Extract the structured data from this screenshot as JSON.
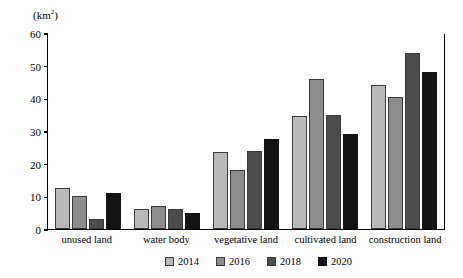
{
  "chart_data": {
    "type": "bar",
    "title": "",
    "xlabel": "",
    "ylabel": "(km2)",
    "ylabel_base": "(km",
    "ylabel_sup": "2",
    "ylabel_close": ")",
    "ylim": [
      0,
      60
    ],
    "yticks": [
      60,
      50,
      40,
      30,
      20,
      10,
      0
    ],
    "grid": false,
    "legend_position": "bottom",
    "categories": [
      "unused land",
      "water body",
      "vegetative land",
      "cultivated land",
      "construction land"
    ],
    "series": [
      {
        "name": "2014",
        "color": "#b9b9b9",
        "values": [
          12.5,
          6.0,
          23.5,
          34.5,
          44.0
        ]
      },
      {
        "name": "2016",
        "color": "#8c8c8c",
        "values": [
          10.0,
          7.0,
          18.0,
          46.0,
          40.5
        ]
      },
      {
        "name": "2018",
        "color": "#4d4d4d",
        "values": [
          3.0,
          6.0,
          24.0,
          35.0,
          54.0
        ]
      },
      {
        "name": "2020",
        "color": "#141414",
        "values": [
          11.0,
          5.0,
          27.5,
          29.0,
          48.0
        ]
      }
    ]
  }
}
